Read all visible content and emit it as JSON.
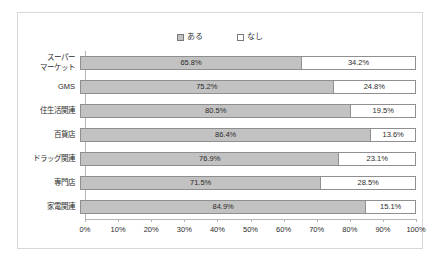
{
  "chart_data": {
    "type": "bar",
    "orientation": "horizontal",
    "stacked": true,
    "normalized_percent": true,
    "title": "",
    "subtitle": "",
    "xlabel": "",
    "ylabel": "",
    "xlim": [
      0,
      100
    ],
    "grid": false,
    "legend_position": "top-center",
    "categories": [
      "スーパー\nマーケット",
      "GMS",
      "住生活関連",
      "百貨店",
      "ドラッグ関連",
      "専門店",
      "家電関連"
    ],
    "series": [
      {
        "name": "ある",
        "color": "#c2c2c2",
        "values": [
          65.8,
          75.2,
          80.5,
          86.4,
          76.9,
          71.5,
          84.9
        ],
        "labels": [
          "65.8%",
          "75.2%",
          "80.5%",
          "86.4%",
          "76.9%",
          "71.5%",
          "84.9%"
        ]
      },
      {
        "name": "なし",
        "color": "#ffffff",
        "values": [
          34.2,
          24.8,
          19.5,
          13.6,
          23.1,
          28.5,
          15.1
        ],
        "labels": [
          "34.2%",
          "24.8%",
          "19.5%",
          "13.6%",
          "23.1%",
          "28.5%",
          "15.1%"
        ]
      }
    ],
    "xticks": [
      0,
      10,
      20,
      30,
      40,
      50,
      60,
      70,
      80,
      90,
      100
    ],
    "xtick_labels": [
      "0%",
      "10%",
      "20%",
      "30%",
      "40%",
      "50%",
      "60%",
      "70%",
      "80%",
      "90%",
      "100%"
    ]
  },
  "legend": {
    "entries": [
      {
        "label": "ある",
        "swatch": "filled-gray-swatch-icon"
      },
      {
        "label": "なし",
        "swatch": "empty-white-swatch-icon"
      }
    ]
  },
  "colors": {
    "series_aru": "#c2c2c2",
    "series_nashi": "#ffffff",
    "bar_border": "#8f8f8f",
    "axis": "#b4b4b4",
    "frame": "#d8d8d8",
    "text": "#2b2b2b"
  }
}
